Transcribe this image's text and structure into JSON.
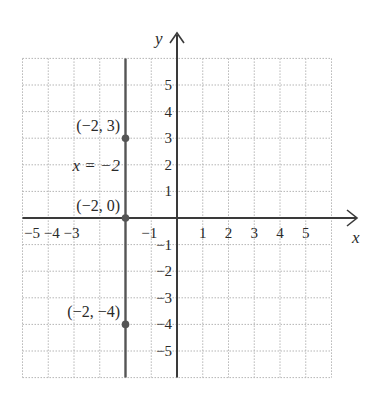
{
  "chart_data": {
    "type": "line",
    "title": "",
    "xlabel": "x",
    "ylabel": "y",
    "xlim": [
      -6,
      6
    ],
    "ylim": [
      -6,
      6
    ],
    "grid": true,
    "x_ticks": [
      "-5",
      "-4",
      "-3",
      "-1",
      "1",
      "2",
      "3",
      "4",
      "5"
    ],
    "x_tick_values": [
      -5,
      -4,
      -3,
      -1,
      1,
      2,
      3,
      4,
      5
    ],
    "y_ticks": [
      "5",
      "4",
      "3",
      "2",
      "1",
      "-1",
      "-2",
      "-3",
      "-4",
      "-5"
    ],
    "y_tick_values": [
      5,
      4,
      3,
      2,
      1,
      -1,
      -2,
      -3,
      -4,
      -5
    ],
    "series": [
      {
        "name": "x = -2",
        "kind": "vertical_line",
        "x": -2,
        "points": [
          {
            "x": -2,
            "y": 3,
            "label": "(−2, 3)"
          },
          {
            "x": -2,
            "y": 0,
            "label": "(−2, 0)"
          },
          {
            "x": -2,
            "y": -4,
            "label": "(−2, −4)"
          }
        ]
      }
    ],
    "annotations": [
      {
        "text": "x = −2",
        "x": -4.5,
        "y": 2
      }
    ]
  },
  "labels": {
    "x_axis": "x",
    "y_axis": "y",
    "equation": "x = −2",
    "tick_x_neg": "−5 −4 −3",
    "tick_x_m1": "−1",
    "p1": "(−2, 3)",
    "p2": "(−2, 0)",
    "p3": "(−2, −4)"
  },
  "colors": {
    "axis": "#3a3a3a",
    "line": "#555555",
    "grid": "#b5b5b5",
    "point": "#555555"
  }
}
